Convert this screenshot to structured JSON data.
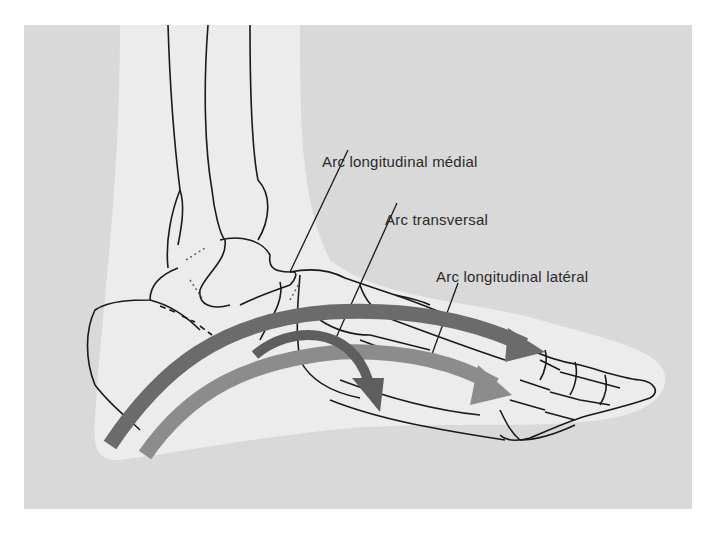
{
  "figure": {
    "labels": [
      {
        "id": "medial",
        "text": "Arc longitudinal médial"
      },
      {
        "id": "transverse",
        "text": "Arc transversal"
      },
      {
        "id": "lateral",
        "text": "Arc longitudinal latéral"
      }
    ],
    "arrows": [
      {
        "name": "medial-longitudinal-arch-arrow",
        "color": "#6b6b6b"
      },
      {
        "name": "transverse-arch-arrow",
        "color": "#5e5e5e"
      },
      {
        "name": "lateral-longitudinal-arch-arrow",
        "color": "#8c8c8c"
      }
    ],
    "colors": {
      "panel": "#d9d9d9",
      "silhouette": "#ececec",
      "bone_outline": "#1a1a1a"
    }
  }
}
